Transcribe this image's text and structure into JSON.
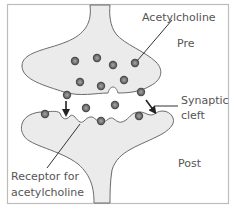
{
  "diagram": {
    "labels": {
      "neurotransmitter": "Acetylcholine",
      "presynaptic": "Pre",
      "cleft_line1": "Synaptic",
      "cleft_line2": "cleft",
      "postsynaptic": "Post",
      "receptor_line1": "Receptor for",
      "receptor_line2": "acetylcholine"
    },
    "colors": {
      "frame": "#bdbdbd",
      "membrane_fill": "#ebebeb",
      "membrane_stroke": "#6a6a6a",
      "vesicle_dark": "#3d3d3d",
      "vesicle_light": "#9a9a9a",
      "label_text": "#555555"
    },
    "vesicles": {
      "in_presynaptic_terminal": 7,
      "docked_at_pre_membrane": 2,
      "in_synaptic_cleft": 2,
      "bound_to_post_receptors": 3
    },
    "arrows": 2
  }
}
